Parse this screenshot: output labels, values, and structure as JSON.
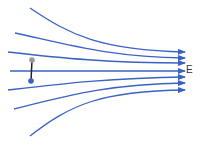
{
  "diagram": {
    "field_label": "E",
    "colors": {
      "field_line": "#3a62c4",
      "dipole_rod": "#222222",
      "positive_charge": "#9a9a9a",
      "negative_charge": "#3a62c4"
    },
    "field_lines": [
      {
        "start": [
          30,
          8
        ],
        "end": [
          185,
          52
        ]
      },
      {
        "start": [
          15,
          33
        ],
        "end": [
          185,
          58
        ]
      },
      {
        "start": [
          8,
          52
        ],
        "end": [
          185,
          63
        ]
      },
      {
        "start": [
          10,
          71
        ],
        "end": [
          185,
          71
        ]
      },
      {
        "start": [
          8,
          90
        ],
        "end": [
          185,
          77
        ]
      },
      {
        "start": [
          14,
          109
        ],
        "end": [
          185,
          83
        ]
      },
      {
        "start": [
          30,
          136
        ],
        "end": [
          185,
          90
        ]
      }
    ],
    "dipole": {
      "top_charge": [
        32,
        60
      ],
      "bottom_charge": [
        31,
        81
      ]
    }
  }
}
